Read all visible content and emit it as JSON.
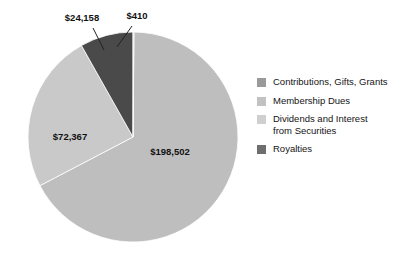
{
  "chart_data": {
    "type": "pie",
    "title": "",
    "subtitle": "",
    "xlabel": "",
    "ylabel": "",
    "grid": false,
    "legend_position": "right",
    "total": 295437,
    "categories": [
      "Contributions, Gifts, Grants",
      "Membership Dues",
      "Dividends and Interest from Securities",
      "Royalties"
    ],
    "values": [
      198502,
      72367,
      410,
      24158
    ],
    "value_labels": [
      "$198,502",
      "$72,367",
      "$410",
      "$24,158"
    ],
    "colors": [
      "#bebebe",
      "#c9c9c9",
      "#d4d4d4",
      "#4a4a4a"
    ],
    "slices": [
      {
        "name": "Contributions, Gifts, Grants",
        "value": 198502,
        "label": "$198,502",
        "color": "#bebebe",
        "start_angle": 0.5,
        "end_angle": 242.4,
        "label_x": 170,
        "label_y": 155,
        "label_anchor": "middle",
        "has_leader": false
      },
      {
        "name": "Membership Dues",
        "value": 72367,
        "label": "$72,367",
        "color": "#c9c9c9",
        "start_angle": 242.4,
        "end_angle": 330.6,
        "label_x": 70,
        "label_y": 140,
        "label_anchor": "middle",
        "has_leader": false
      },
      {
        "name": "Royalties",
        "value": 24158,
        "label": "$24,158",
        "color": "#4a4a4a",
        "start_angle": 330.6,
        "end_angle": 360.0,
        "label_x": 82,
        "label_y": 21,
        "label_anchor": "middle",
        "has_leader": true,
        "leader_x1": 93,
        "leader_y1": 28,
        "leader_x2": 104,
        "leader_y2": 50
      },
      {
        "name": "Dividends and Interest from Securities",
        "value": 410,
        "label": "$410",
        "color": "#d4d4d4",
        "start_angle": 0.0,
        "end_angle": 0.5,
        "label_x": 137,
        "label_y": 19,
        "label_anchor": "middle",
        "has_leader": true,
        "leader_x1": 132,
        "leader_y1": 26,
        "leader_x2": 117,
        "leader_y2": 47
      }
    ],
    "geometry": {
      "center_x": 133,
      "center_y": 137,
      "radius": 105
    }
  },
  "legend": {
    "items": [
      {
        "label": "Contributions, Gifts, Grants",
        "color": "#9a9a9a"
      },
      {
        "label": "Membership Dues",
        "color": "#c2c2c2"
      },
      {
        "label": "Dividends and Interest\nfrom Securities",
        "color": "#cfcfcf"
      },
      {
        "label": "Royalties",
        "color": "#6e6e6e"
      }
    ]
  }
}
